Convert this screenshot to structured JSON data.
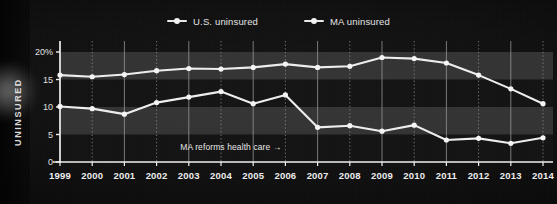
{
  "title_remnant": "",
  "axis": {
    "y_label": "UNINSURED",
    "y_ticks": [
      "20%",
      "15",
      "10",
      "5",
      "0"
    ],
    "y_tick_values": [
      20,
      15,
      10,
      5,
      0
    ]
  },
  "legend": {
    "items": [
      {
        "label": "U.S. uninsured",
        "color": "#ededed"
      },
      {
        "label": "MA uninsured",
        "color": "#ededed"
      }
    ]
  },
  "annotation": {
    "text": "MA reforms health care",
    "arrow": "→",
    "year": 2006
  },
  "colors": {
    "line": "#e9e9e9",
    "marker": "#f4f4f4",
    "axis": "#f0f0f0",
    "grid_solid": "#9a9a9a",
    "grid_dotted": "#8f8f8f",
    "band_light": "#3a3a3a",
    "band_dark": "#141414",
    "background": "#0c0c0c",
    "text": "#e6e6e6"
  },
  "chart_data": {
    "type": "line",
    "title": "",
    "subtitle": "",
    "xlabel": "",
    "ylabel": "UNINSURED",
    "ylim": [
      0,
      21
    ],
    "xlim": [
      1999,
      2014
    ],
    "grid": true,
    "legend_position": "top-center",
    "y_unit": "percent",
    "categories": [
      "1999",
      "2000",
      "2001",
      "2002",
      "2003",
      "2004",
      "2005",
      "2006",
      "2007",
      "2008",
      "2009",
      "2010",
      "2011",
      "2012",
      "2013",
      "2014"
    ],
    "x": [
      1999,
      2000,
      2001,
      2002,
      2003,
      2004,
      2005,
      2006,
      2007,
      2008,
      2009,
      2010,
      2011,
      2012,
      2013,
      2014
    ],
    "series": [
      {
        "name": "U.S. uninsured",
        "color": "#ededed",
        "values": [
          15.8,
          15.5,
          15.9,
          16.6,
          17.0,
          16.9,
          17.2,
          17.8,
          17.2,
          17.4,
          19.0,
          18.8,
          18.0,
          15.8,
          13.3,
          10.6
        ]
      },
      {
        "name": "MA uninsured",
        "color": "#ededed",
        "values": [
          10.1,
          9.7,
          8.7,
          10.8,
          11.8,
          12.8,
          10.6,
          12.2,
          6.3,
          6.6,
          5.6,
          6.7,
          4.0,
          4.3,
          3.4,
          4.4
        ]
      }
    ],
    "annotations": [
      {
        "text": "MA reforms health care →",
        "x": 2006,
        "y": 2.2
      }
    ],
    "bands": [
      {
        "from": 0,
        "to": 5,
        "shade": "dark"
      },
      {
        "from": 5,
        "to": 10,
        "shade": "light"
      },
      {
        "from": 10,
        "to": 15,
        "shade": "dark"
      },
      {
        "from": 15,
        "to": 20,
        "shade": "light"
      }
    ]
  }
}
